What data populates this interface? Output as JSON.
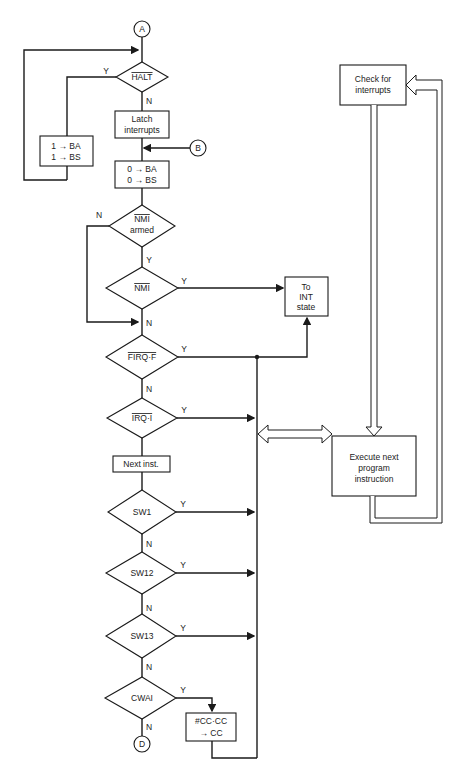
{
  "diagram": {
    "connectors": {
      "a": "A",
      "b": "B",
      "d": "D"
    },
    "nodes": {
      "halt": {
        "label": "HALT",
        "overline": true
      },
      "latch": {
        "line1": "Latch",
        "line2": "interrupts"
      },
      "set_ba_bs": {
        "line1": "1 → BA",
        "line2": "1 → BS"
      },
      "clear_ba_bs": {
        "line1": "0 → BA",
        "line2": "0 → BS"
      },
      "nmi_armed": {
        "line1": "NMI",
        "line2": "armed"
      },
      "nmi": {
        "label": "NMI"
      },
      "firq": {
        "label": "FIRQ·F"
      },
      "irq": {
        "label": "IRQ·I"
      },
      "next_inst": {
        "label": "Next inst."
      },
      "sw1": {
        "label": "SW1"
      },
      "sw12": {
        "label": "SW12"
      },
      "sw13": {
        "label": "SW13"
      },
      "cwai": {
        "label": "CWAI"
      },
      "cc_box": {
        "line1": "#CC·CC",
        "line2": "→ CC"
      },
      "to_int": {
        "line1": "To",
        "line2": "INT",
        "line3": "state"
      },
      "check": {
        "line1": "Check for",
        "line2": "interrupts"
      },
      "execute": {
        "line1": "Execute next",
        "line2": "program",
        "line3": "instruction"
      }
    },
    "branch_labels": {
      "yes": "Y",
      "no": "N"
    }
  }
}
